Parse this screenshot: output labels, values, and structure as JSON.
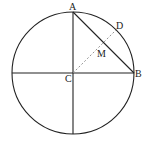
{
  "diagram": {
    "type": "geometry",
    "colors": {
      "stroke": "#222222",
      "dashed": "#888888",
      "background": "#ffffff"
    },
    "circle": {
      "center": "C",
      "cx": 73,
      "cy": 73,
      "r": 61
    },
    "points": {
      "A": {
        "label": "A",
        "x": 73,
        "y": 12
      },
      "B": {
        "label": "B",
        "x": 134,
        "y": 73
      },
      "C": {
        "label": "C",
        "x": 73,
        "y": 73
      },
      "D": {
        "label": "D",
        "x": 116,
        "y": 30
      },
      "M": {
        "label": "M",
        "x": 103,
        "y": 43
      }
    },
    "segments": [
      {
        "name": "horizontal-diameter",
        "from": "left",
        "to": "B",
        "style": "solid"
      },
      {
        "name": "vertical-diameter",
        "from": "A",
        "to": "bottom",
        "style": "solid"
      },
      {
        "name": "chord-AB",
        "from": "A",
        "to": "B",
        "style": "solid"
      },
      {
        "name": "radius-CD",
        "from": "C",
        "to": "D",
        "style": "dashed"
      }
    ]
  }
}
